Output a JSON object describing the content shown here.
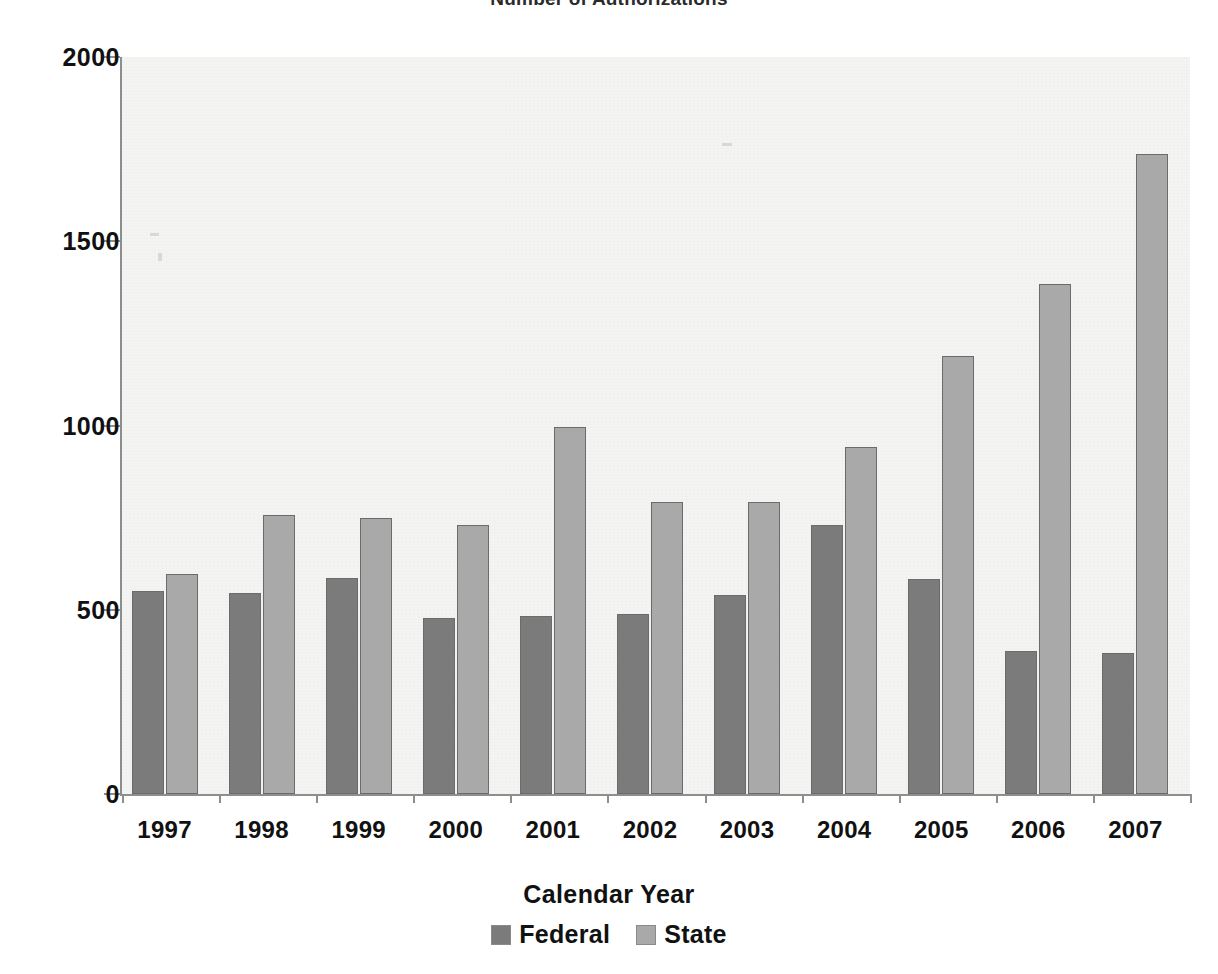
{
  "chart_data": {
    "type": "bar",
    "title": "Number of Authorizations",
    "xlabel": "Calendar Year",
    "ylabel": "",
    "categories": [
      "1997",
      "1998",
      "1999",
      "2000",
      "2001",
      "2002",
      "2003",
      "2004",
      "2005",
      "2006",
      "2007"
    ],
    "series": [
      {
        "name": "Federal",
        "color": "#7b7b7b",
        "values": [
          552,
          545,
          585,
          478,
          483,
          488,
          540,
          730,
          583,
          388,
          383
        ]
      },
      {
        "name": "State",
        "color": "#a9a9a9",
        "values": [
          598,
          758,
          748,
          730,
          995,
          793,
          793,
          942,
          1188,
          1385,
          1738
        ]
      }
    ],
    "ylim": [
      0,
      2000
    ],
    "ytick_labels": [
      "0",
      "500",
      "1000",
      "1500",
      "2000"
    ],
    "ytick_values": [
      0,
      500,
      1000,
      1500,
      2000
    ],
    "grid": false,
    "legend_position": "bottom",
    "plot_background": "#f4f4f2",
    "axis_color": "#8e8e8e"
  },
  "legend": {
    "entries": [
      {
        "label": "Federal",
        "swatch_color": "#7b7b7b"
      },
      {
        "label": "State",
        "swatch_color": "#a9a9a9"
      }
    ]
  }
}
